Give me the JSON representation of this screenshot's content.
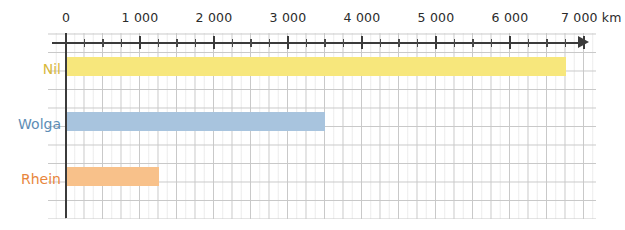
{
  "chart_data": {
    "type": "bar",
    "orientation": "horizontal",
    "title": "",
    "xlabel": "km",
    "ylabel": "",
    "categories": [
      "Nil",
      "Wolga",
      "Rhein"
    ],
    "values": [
      6750,
      3500,
      1250
    ],
    "series": [
      {
        "name": "Flusslänge",
        "values": [
          6750,
          3500,
          1250
        ]
      }
    ],
    "xlim": [
      0,
      7000
    ],
    "xticks": [
      0,
      1000,
      2000,
      3000,
      4000,
      5000,
      6000,
      7000
    ],
    "xtick_labels": [
      "0",
      "1 000",
      "2 000",
      "3 000",
      "4 000",
      "5 000",
      "6 000",
      "7 000 km"
    ],
    "minor_tick_step": 250,
    "grid": true,
    "legend": "none",
    "bar_colors": [
      "#F7E77C",
      "#A8C4DE",
      "#F8C18A"
    ],
    "label_colors": [
      "#D8B93C",
      "#5D8DB5",
      "#E8863C"
    ],
    "axis_color": "#3B3B3B",
    "grid_color": "#C8C8C8"
  },
  "axis": {
    "unit_suffix": "km",
    "arrow_icon": "arrow-right-icon"
  },
  "bars": [
    {
      "label": "Nil",
      "value": 6750,
      "color": "#F7E77C",
      "label_color": "#D8B93C"
    },
    {
      "label": "Wolga",
      "value": 3500,
      "color": "#A8C4DE",
      "label_color": "#5D8DB5"
    },
    {
      "label": "Rhein",
      "value": 1250,
      "color": "#F8C18A",
      "label_color": "#E8863C"
    }
  ],
  "ticks": [
    {
      "label": "0",
      "value": 0
    },
    {
      "label": "1 000",
      "value": 1000
    },
    {
      "label": "2 000",
      "value": 2000
    },
    {
      "label": "3 000",
      "value": 3000
    },
    {
      "label": "4 000",
      "value": 4000
    },
    {
      "label": "5 000",
      "value": 5000
    },
    {
      "label": "6 000",
      "value": 6000
    },
    {
      "label": "7 000 km",
      "value": 7000
    }
  ]
}
